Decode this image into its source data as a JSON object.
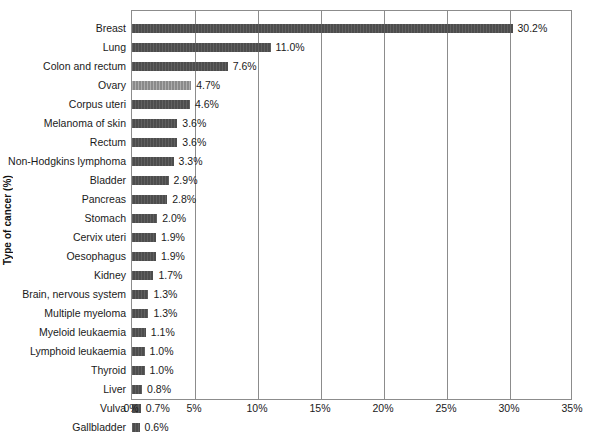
{
  "chart_data": {
    "type": "bar",
    "orientation": "horizontal",
    "title": "",
    "xlabel": "",
    "ylabel": "Type of cancer (%)",
    "xlim": [
      0,
      35
    ],
    "xtick_labels": [
      "0%",
      "5%",
      "10%",
      "15%",
      "20%",
      "25%",
      "30%",
      "35%"
    ],
    "xtick_values": [
      0,
      5,
      10,
      15,
      20,
      25,
      30,
      35
    ],
    "grid": true,
    "legend": "none",
    "categories": [
      "Breast",
      "Lung",
      "Colon and rectum",
      "Ovary",
      "Corpus uteri",
      "Melanoma of skin",
      "Rectum",
      "Non-Hodgkins lymphoma",
      "Bladder",
      "Pancreas",
      "Stomach",
      "Cervix uteri",
      "Oesophagus",
      "Kidney",
      "Brain, nervous system",
      "Multiple myeloma",
      "Myeloid leukaemia",
      "Lymphoid leukaemia",
      "Thyroid",
      "Liver",
      "Vulva",
      "Gallbladder"
    ],
    "values": [
      30.2,
      11.0,
      7.6,
      4.7,
      4.6,
      3.6,
      3.6,
      3.3,
      2.9,
      2.8,
      2.0,
      1.9,
      1.9,
      1.7,
      1.3,
      1.3,
      1.1,
      1.0,
      1.0,
      0.8,
      0.7,
      0.6
    ],
    "value_labels": [
      "30.2%",
      "11.0%",
      "7.6%",
      "4.7%",
      "4.6%",
      "3.6%",
      "3.6%",
      "3.3%",
      "2.9%",
      "2.8%",
      "2.0%",
      "1.9%",
      "1.9%",
      "1.7%",
      "1.3%",
      "1.3%",
      "1.1%",
      "1.0%",
      "1.0%",
      "0.8%",
      "0.7%",
      "0.6%"
    ],
    "highlighted_index": 3,
    "colors": {
      "bar": "#4d4d4d",
      "bar_highlight": "#8a8a8a",
      "axis": "#8c8c8c",
      "text": "#1a1a1a",
      "background": "#ffffff"
    }
  }
}
